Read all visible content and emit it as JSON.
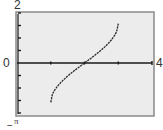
{
  "chart_data": {
    "type": "line",
    "title": "",
    "xlabel": "",
    "ylabel": "",
    "xlim": [
      0,
      4
    ],
    "ylim": [
      -2,
      2
    ],
    "x_tick_step": 1,
    "y_tick_step": 0.5,
    "grid": false,
    "legend": null,
    "axis_labels": {
      "x_min": "0",
      "x_max": "4",
      "y_max": "2",
      "y_min_note": "−π"
    },
    "series": [
      {
        "name": "y = arcsin(x − 2)",
        "x": [
          1.0,
          1.05,
          1.1,
          1.2,
          1.3,
          1.4,
          1.5,
          1.6,
          1.7,
          1.8,
          1.9,
          2.0,
          2.1,
          2.2,
          2.3,
          2.4,
          2.5,
          2.6,
          2.7,
          2.8,
          2.9,
          2.95,
          3.0
        ],
        "values": [
          -1.571,
          -1.253,
          -1.12,
          -0.927,
          -0.775,
          -0.644,
          -0.524,
          -0.412,
          -0.305,
          -0.201,
          -0.1,
          0.0,
          0.1,
          0.201,
          0.305,
          0.412,
          0.524,
          0.644,
          0.775,
          0.927,
          1.12,
          1.253,
          1.571
        ]
      }
    ]
  },
  "labels": {
    "y_top": "2",
    "x_left": "0",
    "x_right": "4",
    "bottom": "π",
    "bottom_sign": "−"
  },
  "colors": {
    "frame": "#8a8a8a",
    "plot_bg": "#ececec",
    "axis": "#1a1a1a",
    "curve": "#2a2a2a"
  }
}
